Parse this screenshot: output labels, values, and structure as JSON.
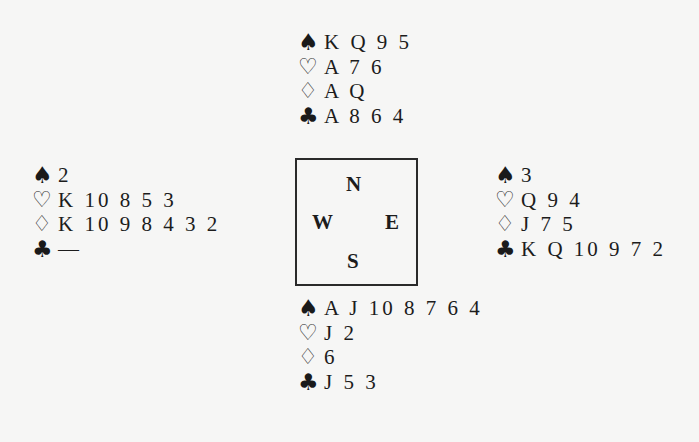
{
  "diagram": {
    "type": "bridge-deal",
    "suit_symbols": {
      "spades": "♠",
      "hearts": "♡",
      "diamonds": "♢",
      "clubs": "♣"
    },
    "compass": {
      "north": "N",
      "west": "W",
      "east": "E",
      "south": "S"
    },
    "hands": {
      "north": {
        "spades": "K Q 9 5",
        "hearts": "A 7 6",
        "diamonds": "A Q",
        "clubs": "A 8 6 4"
      },
      "west": {
        "spades": "2",
        "hearts": "K 10 8 5 3",
        "diamonds": "K 10 9 8 4 3 2",
        "clubs": "—"
      },
      "east": {
        "spades": "3",
        "hearts": "Q 9 4",
        "diamonds": "J 7 5",
        "clubs": "K Q 10 9 7 2"
      },
      "south": {
        "spades": "A J 10 8 7 6 4",
        "hearts": "J 2",
        "diamonds": "6",
        "clubs": "J 5 3"
      }
    }
  }
}
